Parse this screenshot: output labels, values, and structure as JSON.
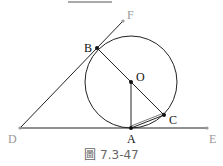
{
  "figure": {
    "caption": "圖 7.3-47",
    "points": {
      "B": {
        "label": "B",
        "x": 97,
        "y": 48
      },
      "F": {
        "label": "F",
        "x": 123,
        "y": 21
      },
      "O": {
        "label": "O",
        "x": 131,
        "y": 82
      },
      "A": {
        "label": "A",
        "x": 131,
        "y": 128
      },
      "C": {
        "label": "C",
        "x": 164,
        "y": 115
      },
      "D": {
        "label": "D",
        "x": 20,
        "y": 128
      },
      "E": {
        "label": "E",
        "x": 207,
        "y": 128
      }
    },
    "circle": {
      "center": "O",
      "radius": 46
    },
    "colors": {
      "line": "#222222",
      "faded": "#999999",
      "caption": "#666666"
    }
  }
}
